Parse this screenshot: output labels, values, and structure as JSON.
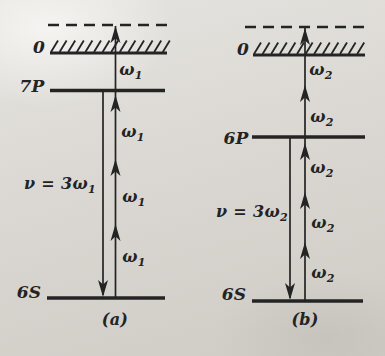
{
  "colors": {
    "ink": "#242424",
    "paper": "#d9d6d1"
  },
  "panels": [
    {
      "caption": "(a)",
      "caption_cx": 115,
      "caption_cy": 320,
      "levels": [
        {
          "name": "virtual-level",
          "label": "",
          "style": "dashed",
          "y": 25,
          "x1": 48,
          "x2": 168
        },
        {
          "name": "ionization-limit",
          "label": "0",
          "style": "hatched",
          "y": 53,
          "x1": 50,
          "x2": 167,
          "label_cx": 39,
          "label_cy": 47
        },
        {
          "name": "level-7P",
          "label": "7P",
          "style": "solid",
          "y": 90.5,
          "x1": 50,
          "x2": 165,
          "label_cx": 32,
          "label_cy": 86
        },
        {
          "name": "level-6S",
          "label": "6S",
          "style": "solid",
          "y": 298,
          "x1": 47,
          "x2": 165,
          "label_cx": 29,
          "label_cy": 292
        }
      ],
      "up_arrow": {
        "x": 115.5,
        "y_top": 26,
        "y_bottom": 298,
        "head_tips_y": [
          26,
          95,
          159,
          224
        ]
      },
      "down_arrow": {
        "x": 103,
        "y_top": 92,
        "y_bottom": 297
      },
      "photon_labels": [
        {
          "base": "ω",
          "sub": "1",
          "cx": 131,
          "cy": 70
        },
        {
          "base": "ω",
          "sub": "1",
          "cx": 133,
          "cy": 132
        },
        {
          "base": "ω",
          "sub": "1",
          "cx": 134,
          "cy": 197
        },
        {
          "base": "ω",
          "sub": "1",
          "cx": 134,
          "cy": 257
        }
      ],
      "emission_label": {
        "base": "ν = 3ω",
        "sub": "1",
        "cx": 60,
        "cy": 184
      }
    },
    {
      "caption": "(b)",
      "caption_cx": 305,
      "caption_cy": 320,
      "levels": [
        {
          "name": "virtual-level",
          "label": "",
          "style": "dashed",
          "y": 27,
          "x1": 245,
          "x2": 365
        },
        {
          "name": "ionization-limit",
          "label": "0",
          "style": "hatched",
          "y": 55,
          "x1": 253,
          "x2": 365,
          "label_cx": 243,
          "label_cy": 49
        },
        {
          "name": "level-6P",
          "label": "6P",
          "style": "solid",
          "y": 137,
          "x1": 252,
          "x2": 365,
          "label_cx": 236,
          "label_cy": 138
        },
        {
          "name": "level-6S",
          "label": "6S",
          "style": "solid",
          "y": 301,
          "x1": 252,
          "x2": 363,
          "label_cx": 234,
          "label_cy": 294
        }
      ],
      "up_arrow": {
        "x": 305,
        "y_top": 28,
        "y_bottom": 301,
        "head_tips_y": [
          28,
          85,
          143,
          192,
          242
        ]
      },
      "down_arrow": {
        "x": 290,
        "y_top": 138,
        "y_bottom": 300
      },
      "photon_labels": [
        {
          "base": "ω",
          "sub": "2",
          "cx": 321,
          "cy": 70
        },
        {
          "base": "ω",
          "sub": "2",
          "cx": 322,
          "cy": 117
        },
        {
          "base": "ω",
          "sub": "2",
          "cx": 322,
          "cy": 168
        },
        {
          "base": "ω",
          "sub": "2",
          "cx": 323,
          "cy": 223
        },
        {
          "base": "ω",
          "sub": "2",
          "cx": 323,
          "cy": 273
        }
      ],
      "emission_label": {
        "base": "ν = 3ω",
        "sub": "2",
        "cx": 252,
        "cy": 212
      }
    }
  ]
}
